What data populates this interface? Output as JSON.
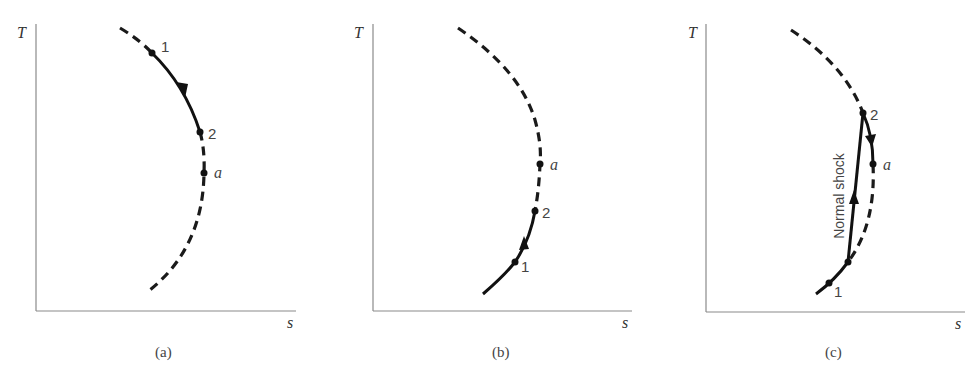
{
  "figure": {
    "panels": [
      {
        "id": "a",
        "caption": "(a)",
        "y_axis_label": "T",
        "x_axis_label": "s",
        "points": [
          {
            "label": "1",
            "style": "numeral"
          },
          {
            "label": "2",
            "style": "numeral"
          },
          {
            "label": "a",
            "style": "italic"
          }
        ],
        "process": "solid path 1 → 2 along dashed curve, arrow pointing downward toward 2"
      },
      {
        "id": "b",
        "caption": "(b)",
        "y_axis_label": "T",
        "x_axis_label": "s",
        "points": [
          {
            "label": "1",
            "style": "numeral"
          },
          {
            "label": "2",
            "style": "numeral"
          },
          {
            "label": "a",
            "style": "italic"
          }
        ],
        "process": "solid path 1 → 2 along lower branch of curve, arrow pointing upward toward 2"
      },
      {
        "id": "c",
        "caption": "(c)",
        "y_axis_label": "T",
        "x_axis_label": "s",
        "points": [
          {
            "label": "1",
            "style": "numeral"
          },
          {
            "label": "2",
            "style": "numeral"
          },
          {
            "label": "a",
            "style": "italic"
          }
        ],
        "annotation": "Normal shock",
        "process": "solid path from 1 along lower branch, then normal shock jump upward to 2, then 2 → a with downward arrow"
      }
    ],
    "colors": {
      "curve": "#111111",
      "axis": "#8a8a8a",
      "text": "#444444",
      "background": "#ffffff"
    }
  }
}
